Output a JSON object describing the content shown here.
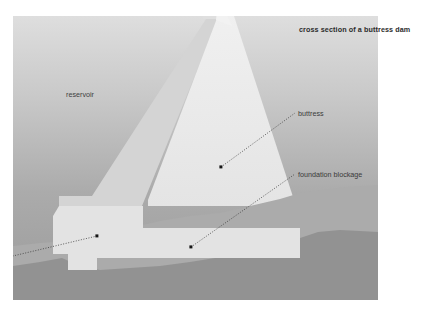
{
  "figure": {
    "title": "cross section of a buttress dam",
    "type": "technical-cross-section-illustration",
    "labels": {
      "reservoir": "reservoir",
      "buttress": "buttress",
      "foundation_blockage": "foundation blockage"
    },
    "colors": {
      "page_background": "#ffffff",
      "reservoir_top": "#d9d9d9",
      "reservoir_bottom": "#9a9a9a",
      "buttress_body": "#ebebeb",
      "buttress_face": "#dcdcdc",
      "crest_shadow": "#cfcfcf",
      "soil_layer": "#a8a8a8",
      "bedrock_layer": "#8f8f8f",
      "foundation_slab": "#e2e2e2",
      "leader_line": "#3a3a3a",
      "marker_dot": "#1a1a1a",
      "title_text": "#2b2b2b",
      "label_text": "#3a3a3a"
    },
    "markers": [
      {
        "name": "buttress-marker",
        "x": 221,
        "y": 167
      },
      {
        "name": "foundation-marker",
        "x": 191,
        "y": 247
      },
      {
        "name": "base-marker",
        "x": 97,
        "y": 236
      }
    ],
    "leaders": [
      {
        "name": "buttress-leader",
        "x1": 221,
        "y1": 167,
        "x2": 295,
        "y2": 113
      },
      {
        "name": "foundation-leader",
        "x1": 191,
        "y1": 247,
        "x2": 295,
        "y2": 174
      },
      {
        "name": "base-leader",
        "x1": 97,
        "y1": 236,
        "x2": 0,
        "y2": 259
      }
    ]
  }
}
